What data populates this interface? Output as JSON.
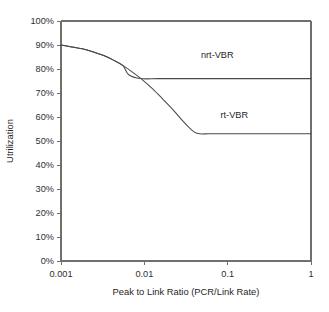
{
  "chart_data": {
    "type": "line",
    "title": "",
    "subtitle": "",
    "xlabel": "Peak to Link Ratio (PCR/Link Rate)",
    "ylabel": "Utrilization",
    "xscale": "log",
    "xlim": [
      0.001,
      1
    ],
    "ylim": [
      0,
      1
    ],
    "grid": false,
    "legend_position": "inline-annotation",
    "xticks": [
      0.001,
      0.01,
      0.1,
      1
    ],
    "xtick_labels": [
      "0.001",
      "0.01",
      "0.1",
      "1"
    ],
    "yticks": [
      0,
      0.1,
      0.2,
      0.3,
      0.4,
      0.5,
      0.6,
      0.7,
      0.8,
      0.9,
      1
    ],
    "ytick_labels": [
      "0%",
      "10%",
      "20%",
      "30%",
      "40%",
      "50%",
      "60%",
      "70%",
      "80%",
      "90%",
      "100%"
    ],
    "series": [
      {
        "name": "nrt-VBR",
        "label": "nrt-VBR",
        "color": "#4a4a4a",
        "x": [
          0.001,
          0.0013,
          0.0018,
          0.0024,
          0.0032,
          0.0042,
          0.0055,
          0.0065,
          0.009,
          0.015,
          0.03,
          0.06,
          0.12,
          0.3,
          0.6,
          1
        ],
        "values": [
          0.9,
          0.893,
          0.884,
          0.872,
          0.857,
          0.838,
          0.815,
          0.776,
          0.76,
          0.76,
          0.76,
          0.76,
          0.76,
          0.76,
          0.76,
          0.76
        ]
      },
      {
        "name": "rt-VBR",
        "label": "rt-VBR",
        "color": "#4a4a4a",
        "x": [
          0.001,
          0.0013,
          0.0018,
          0.0024,
          0.0032,
          0.0042,
          0.0055,
          0.0072,
          0.0095,
          0.0125,
          0.0165,
          0.022,
          0.028,
          0.034,
          0.04,
          0.046,
          0.06,
          0.1,
          0.2,
          0.4,
          0.7,
          1
        ],
        "values": [
          0.9,
          0.893,
          0.884,
          0.872,
          0.857,
          0.838,
          0.815,
          0.787,
          0.755,
          0.718,
          0.676,
          0.631,
          0.589,
          0.558,
          0.537,
          0.53,
          0.53,
          0.53,
          0.53,
          0.53,
          0.53,
          0.53
        ]
      }
    ],
    "annotations": [
      {
        "text": "nrt-VBR",
        "x": 0.075,
        "y": 0.845
      },
      {
        "text": "rt-VBR",
        "x": 0.12,
        "y": 0.595
      }
    ]
  },
  "axes": {
    "y_title": "Utrilization",
    "x_title": "Peak to Link Ratio (PCR/Link Rate)"
  },
  "colors": {
    "axis": "#6f6f6f",
    "line": "#4a4a4a",
    "text": "#1f1f1f",
    "background": "#ffffff"
  }
}
